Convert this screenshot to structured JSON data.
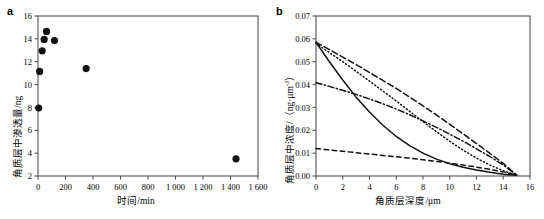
{
  "figure": {
    "panels": [
      {
        "id": "a",
        "label": "a",
        "chart_index": 0
      },
      {
        "id": "b",
        "label": "b",
        "chart_index": 1
      }
    ]
  },
  "chart_data": [
    {
      "type": "scatter",
      "panel": "a",
      "title": "",
      "xlabel": "时间/min",
      "ylabel": "角质层中渗透量/ng",
      "xlim": [
        0,
        1600
      ],
      "ylim": [
        2,
        16
      ],
      "xticks": [
        0,
        200,
        400,
        600,
        800,
        1000,
        1200,
        1400,
        1600
      ],
      "xtick_labels": [
        "0",
        "200",
        "400",
        "600",
        "800",
        "1 000",
        "1 200",
        "1 400",
        "1 600"
      ],
      "yticks": [
        2,
        4,
        6,
        8,
        10,
        12,
        14,
        16
      ],
      "ytick_labels": [
        "2",
        "4",
        "6",
        "8",
        "10",
        "12",
        "14",
        "16"
      ],
      "grid": false,
      "legend": false,
      "marker": "filled-circle",
      "marker_color": "#111111",
      "points": [
        {
          "x": 5,
          "y": 7.95
        },
        {
          "x": 12,
          "y": 11.15
        },
        {
          "x": 30,
          "y": 12.95
        },
        {
          "x": 45,
          "y": 13.95
        },
        {
          "x": 62,
          "y": 14.65
        },
        {
          "x": 120,
          "y": 13.85
        },
        {
          "x": 350,
          "y": 11.4
        },
        {
          "x": 1440,
          "y": 3.5
        }
      ]
    },
    {
      "type": "line",
      "panel": "b",
      "title": "",
      "xlabel": "角质层深度/μm",
      "ylabel": "角质层中浓度/（ng·μm⁻³）",
      "ylabel_parts": {
        "main": "角质层中浓度/（ng·μm",
        "exponent": "-3",
        "tail": "）"
      },
      "xlim": [
        0,
        16
      ],
      "ylim": [
        0,
        0.07
      ],
      "xticks": [
        0,
        2,
        4,
        6,
        8,
        10,
        12,
        14,
        16
      ],
      "xtick_labels": [
        "0",
        "2",
        "4",
        "6",
        "8",
        "10",
        "12",
        "14",
        "16"
      ],
      "yticks": [
        0.0,
        0.01,
        0.02,
        0.03,
        0.04,
        0.05,
        0.06,
        0.07
      ],
      "ytick_labels": [
        "0.00",
        "0.01",
        "0.02",
        "0.03",
        "0.04",
        "0.05",
        "0.06",
        "0.07"
      ],
      "grid": false,
      "legend": false,
      "line_color": "#111111",
      "x": [
        0,
        1,
        2,
        3,
        4,
        5,
        6,
        7,
        8,
        9,
        10,
        11,
        12,
        13,
        14,
        15
      ],
      "series": [
        {
          "name": "solid-curve",
          "style": "solid",
          "values": [
            0.0585,
            0.05,
            0.042,
            0.0345,
            0.028,
            0.0222,
            0.0173,
            0.0133,
            0.01,
            0.0074,
            0.0054,
            0.0038,
            0.0026,
            0.0016,
            0.0008,
            0.0003
          ]
        },
        {
          "name": "dotted-curve",
          "style": "dotted",
          "values": [
            0.058,
            0.054,
            0.05,
            0.0458,
            0.0415,
            0.0372,
            0.0328,
            0.0283,
            0.0238,
            0.0194,
            0.0152,
            0.0113,
            0.0078,
            0.0048,
            0.0023,
            0.0003
          ]
        },
        {
          "name": "long-dash-curve",
          "style": "long-dash",
          "values": [
            0.0585,
            0.0553,
            0.052,
            0.0487,
            0.0453,
            0.0418,
            0.0383,
            0.0345,
            0.0307,
            0.0267,
            0.0226,
            0.0184,
            0.0142,
            0.0099,
            0.0055,
            0.0004
          ]
        },
        {
          "name": "dash-dot-curve",
          "style": "dash-dot",
          "values": [
            0.0408,
            0.0392,
            0.0375,
            0.0357,
            0.0337,
            0.0316,
            0.0293,
            0.0268,
            0.0241,
            0.0213,
            0.0183,
            0.0152,
            0.0119,
            0.0085,
            0.0048,
            0.0004
          ]
        },
        {
          "name": "short-dash-curve",
          "style": "short-dash",
          "values": [
            0.012,
            0.0114,
            0.0108,
            0.0102,
            0.0096,
            0.009,
            0.0084,
            0.0078,
            0.0071,
            0.0064,
            0.0056,
            0.0048,
            0.0039,
            0.0029,
            0.0018,
            0.0004
          ]
        }
      ]
    }
  ]
}
